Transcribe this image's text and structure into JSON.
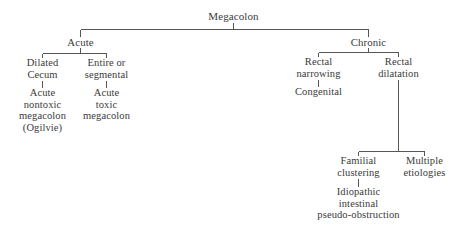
{
  "diagram": {
    "type": "tree",
    "line_color": "#55555a",
    "text_color": "#3a3a3a",
    "background": "#ffffff",
    "nodes": {
      "root": {
        "label": "Megacolon"
      },
      "acute": {
        "label": "Acute"
      },
      "chronic": {
        "label": "Chronic"
      },
      "dilated_cecum": {
        "line1": "Dilated",
        "line2": "Cecum"
      },
      "acute_nontoxic": {
        "line1": "Acute",
        "line2": "nontoxic",
        "line3": "megacolon",
        "line4": "(Ogilvie)"
      },
      "entire_segmental": {
        "line1": "Entire or",
        "line2": "segmental"
      },
      "acute_toxic": {
        "line1": "Acute",
        "line2": "toxic",
        "line3": "megacolon"
      },
      "rectal_narrowing": {
        "line1": "Rectal",
        "line2": "narrowing"
      },
      "congenital": {
        "label": "Congenital"
      },
      "rectal_dilatation": {
        "line1": "Rectal",
        "line2": "dilatation"
      },
      "familial_clustering": {
        "line1": "Familial",
        "line2": "clustering"
      },
      "idiopathic_pseudo_obstruction": {
        "line1": "Idiopathic",
        "line2": "intestinal",
        "line3": "pseudo-obstruction"
      },
      "multiple_etiologies": {
        "line1": "Multiple",
        "line2": "etiologies"
      }
    }
  }
}
